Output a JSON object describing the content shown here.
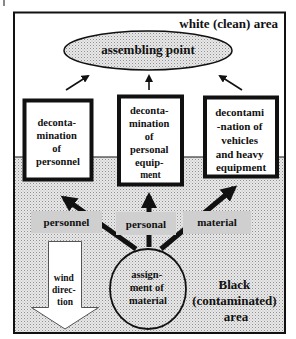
{
  "diagram": {
    "zones": {
      "clean_label": "white (clean) area",
      "contaminated_label_lines": [
        "Black",
        "(contaminated)",
        "area"
      ]
    },
    "assembling_point": {
      "label": "assembling point"
    },
    "stations": [
      {
        "id": "personnel",
        "lines": [
          "deconta-",
          "mination",
          "of",
          "personnel"
        ]
      },
      {
        "id": "personal_equipment",
        "lines": [
          "deconta-",
          "mination",
          "of",
          "personal",
          "equip-",
          "ment"
        ]
      },
      {
        "id": "vehicles",
        "lines": [
          "decontami",
          "-nation of",
          "vehicles",
          "and heavy",
          "equipment"
        ]
      }
    ],
    "flow_labels": [
      "personnel",
      "personal",
      "material"
    ],
    "assignment": {
      "lines": [
        "assign-",
        "ment of",
        "material"
      ]
    },
    "wind": {
      "lines": [
        "wind",
        "direc-",
        "tion"
      ]
    },
    "colors": {
      "frame": "#111111",
      "stipple_bg": "#e6e6e6",
      "stipple_dot": "#9a9a9a",
      "label_box": "#cfcfcf",
      "white": "#ffffff"
    }
  }
}
